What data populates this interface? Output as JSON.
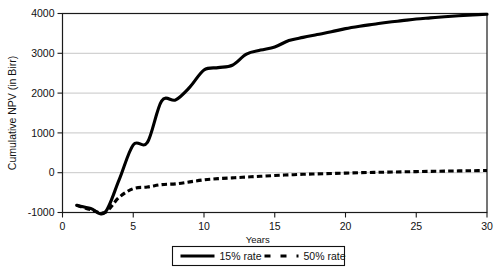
{
  "chart_data": {
    "type": "line",
    "title": "",
    "xlabel": "Years",
    "ylabel": "Cumulative NPV (in Birr)",
    "xlim": [
      0,
      30
    ],
    "ylim": [
      -1000,
      4000
    ],
    "xticks": [
      0,
      5,
      10,
      15,
      20,
      25,
      30
    ],
    "yticks": [
      -1000,
      0,
      1000,
      2000,
      3000,
      4000
    ],
    "xticklabels": [
      "0",
      "5",
      "10",
      "15",
      "20",
      "25",
      "30"
    ],
    "yticklabels": [
      "-1000",
      "0",
      "1000",
      "2000",
      "3000",
      "4000"
    ],
    "grid": "horizontal",
    "legend_position": "bottom-center",
    "x": [
      1,
      2,
      3,
      4,
      5,
      6,
      7,
      8,
      9,
      10,
      11,
      12,
      13,
      14,
      15,
      16,
      17,
      18,
      19,
      20,
      21,
      22,
      23,
      24,
      25,
      26,
      27,
      28,
      29,
      30
    ],
    "series": [
      {
        "name": "15% rate",
        "style": "solid",
        "color": "#000000",
        "values": [
          -820,
          -900,
          -1000,
          -180,
          700,
          760,
          1800,
          1830,
          2150,
          2580,
          2640,
          2700,
          2980,
          3080,
          3160,
          3320,
          3400,
          3470,
          3540,
          3620,
          3680,
          3730,
          3780,
          3820,
          3860,
          3890,
          3920,
          3945,
          3965,
          3980
        ]
      },
      {
        "name": "50% rate",
        "style": "dashed",
        "color": "#000000",
        "values": [
          -820,
          -930,
          -1000,
          -620,
          -400,
          -360,
          -300,
          -280,
          -230,
          -180,
          -150,
          -130,
          -110,
          -90,
          -70,
          -55,
          -40,
          -30,
          -20,
          -10,
          0,
          8,
          15,
          22,
          28,
          34,
          40,
          45,
          50,
          55
        ]
      }
    ]
  },
  "legend": {
    "entries": [
      {
        "label": "15% rate",
        "style": "solid"
      },
      {
        "label": "50% rate",
        "style": "dashed"
      }
    ]
  }
}
